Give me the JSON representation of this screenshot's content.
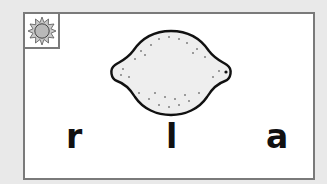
{
  "card": {
    "icon": "sun-icon",
    "picture": "lemon-image",
    "letters": [
      "r",
      "l",
      "a"
    ]
  },
  "colors": {
    "background": "#e9e9e9",
    "card_border": "#7a7a7a",
    "sun_fill": "#b9b9b9",
    "lemon_fill": "#eeeeee"
  }
}
